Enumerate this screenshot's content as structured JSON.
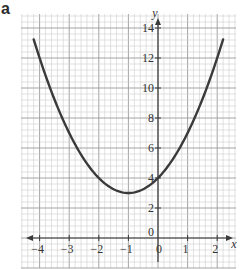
{
  "panel_label": "a",
  "chart_data": {
    "type": "line",
    "title": "",
    "xlabel": "x",
    "ylabel": "y",
    "function": "y = x^2 + 2x + 4",
    "xlim": [
      -4.6,
      2.65
    ],
    "ylim": [
      -2.0,
      15.0
    ],
    "grid": true,
    "x_ticks": [
      -4,
      -3,
      -2,
      -1,
      0,
      1,
      2
    ],
    "x_tick_labels": [
      "−4",
      "−3",
      "−2",
      "−1",
      "0",
      "1",
      "2"
    ],
    "y_ticks": [
      0,
      2,
      4,
      6,
      8,
      10,
      12,
      14
    ],
    "y_tick_labels": [
      "0",
      "2",
      "4",
      "6",
      "8",
      "10",
      "12",
      "14"
    ],
    "series": [
      {
        "name": "parabola",
        "x": [
          -4.2,
          -4,
          -3.5,
          -3,
          -2.5,
          -2,
          -1.5,
          -1,
          -0.5,
          0,
          0.5,
          1,
          1.5,
          2,
          2.2
        ],
        "y": [
          14.24,
          12,
          9.25,
          7,
          5.25,
          4,
          3.25,
          3,
          3.25,
          4,
          5.25,
          7,
          9.25,
          12,
          14.24
        ]
      }
    ],
    "colors": {
      "curve": "#3a3a3a",
      "axis": "#3a3a3a",
      "major_grid": "#9a9a9a",
      "minor_grid": "#cfcfcf"
    }
  }
}
